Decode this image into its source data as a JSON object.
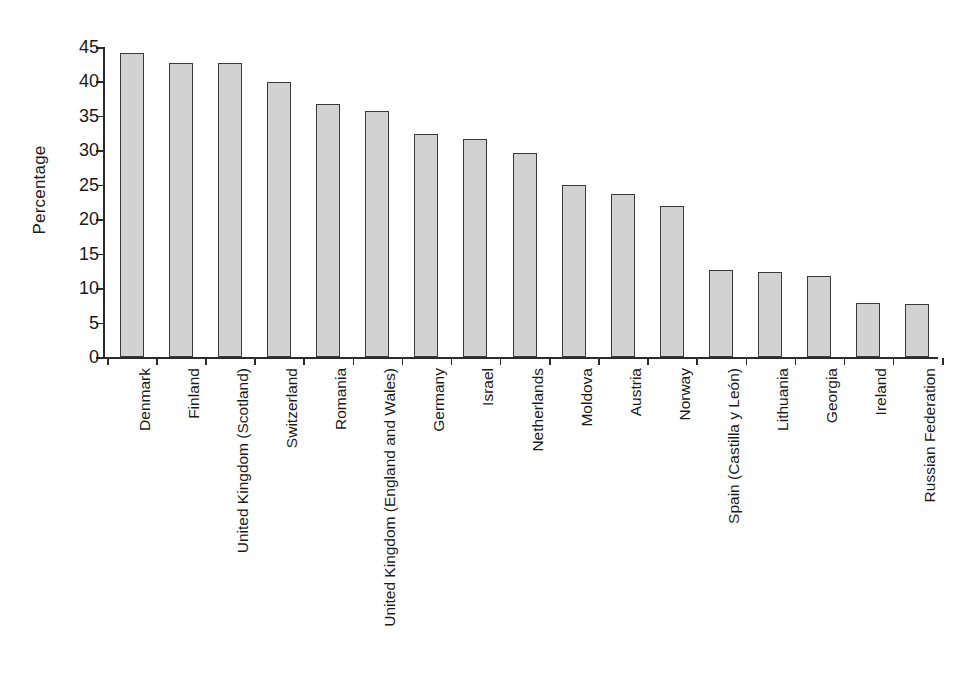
{
  "chart_data": {
    "type": "bar",
    "title": "",
    "subtitle": "",
    "xlabel": "",
    "ylabel": "Percentage",
    "ylim": [
      0,
      45
    ],
    "ytick_labels": [
      "0",
      "5",
      "10",
      "15",
      "20",
      "25",
      "30",
      "35",
      "40",
      "45"
    ],
    "ytick_values": [
      0,
      5,
      10,
      15,
      20,
      25,
      30,
      35,
      40,
      45
    ],
    "grid": false,
    "legend": null,
    "bar_color": "#d2d2d2",
    "bar_edge_color": "#3a3a3a",
    "axis_color": "#2b2b2b",
    "categories": [
      "Denmark",
      "Finland",
      "United Kingdom (Scotland)",
      "Switzerland",
      "Romania",
      "United Kingdom (England and Wales)",
      "Germany",
      "Israel",
      "Netherlands",
      "Moldova",
      "Austria",
      "Norway",
      "Spain (Castilla y León)",
      "Lithuania",
      "Georgia",
      "Ireland",
      "Russian Federation"
    ],
    "values": [
      44.1,
      42.7,
      42.7,
      39.9,
      36.7,
      35.7,
      32.4,
      31.6,
      29.6,
      25.0,
      23.6,
      21.9,
      12.7,
      12.3,
      11.7,
      7.9,
      7.7
    ]
  }
}
